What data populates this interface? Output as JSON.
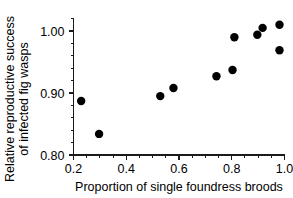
{
  "chart_data": {
    "type": "scatter",
    "title": "",
    "xlabel": "Proportion of single foundress broods",
    "ylabel": "Relative reproductive success of infected fig wasps",
    "ylabel_lines": [
      "Relative reproductive  success",
      "of infected fig wasps"
    ],
    "xlim": [
      0.2,
      1.0
    ],
    "ylim": [
      0.8,
      1.02
    ],
    "xticks": [
      0.2,
      0.4,
      0.6,
      0.8,
      1.0
    ],
    "xtick_labels": [
      "0.2",
      "0.4",
      "0.6",
      "0.8",
      "1.0"
    ],
    "yticks": [
      0.8,
      0.9,
      1.0
    ],
    "ytick_labels": [
      "0.80",
      "0.90",
      "1.00"
    ],
    "x_minor_tick_count": 4,
    "y_minor_tick_count": 5,
    "grid": false,
    "legend": false,
    "marker": "filled-circle",
    "marker_color": "#000000",
    "marker_size": 4.2,
    "points": [
      {
        "x": 0.229,
        "y": 0.887
      },
      {
        "x": 0.297,
        "y": 0.834
      },
      {
        "x": 0.529,
        "y": 0.895
      },
      {
        "x": 0.579,
        "y": 0.908
      },
      {
        "x": 0.742,
        "y": 0.927
      },
      {
        "x": 0.803,
        "y": 0.937
      },
      {
        "x": 0.81,
        "y": 0.99
      },
      {
        "x": 0.897,
        "y": 0.994
      },
      {
        "x": 0.917,
        "y": 1.005
      },
      {
        "x": 0.981,
        "y": 1.01
      },
      {
        "x": 0.981,
        "y": 0.969
      }
    ]
  },
  "axes": {
    "x_title": "Proportion of single foundress broods",
    "y_title_line1": "Relative reproductive  success",
    "y_title_line2": "of infected fig wasps"
  }
}
